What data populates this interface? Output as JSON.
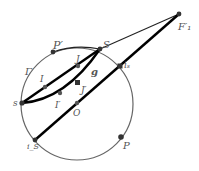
{
  "diagram": {
    "circle": {
      "label": "Γ",
      "cx": 77,
      "cy": 104,
      "r": 56,
      "color": "#666666"
    },
    "points": {
      "P_prime": {
        "label": "P′",
        "x": 53,
        "y": 52
      },
      "S": {
        "label": "S",
        "x": 100,
        "y": 49
      },
      "F1_prime": {
        "label": "F′₁",
        "x": 179,
        "y": 14
      },
      "s": {
        "label": "s",
        "x": 22,
        "y": 103
      },
      "I": {
        "label": "I",
        "x": 45,
        "y": 87
      },
      "J": {
        "label": "J",
        "x": 78,
        "y": 67
      },
      "g": {
        "label": "g"
      },
      "J_prime": {
        "label": "J′",
        "x": 77,
        "y": 82
      },
      "I_prime": {
        "label": "I′",
        "x": 60,
        "y": 93
      },
      "O": {
        "label": "O",
        "x": 77,
        "y": 103
      },
      "i_s": {
        "label": "iₛ",
        "x": 120,
        "y": 66
      },
      "i_S": {
        "label": "i_S",
        "x": 35,
        "y": 140
      },
      "P": {
        "label": "P",
        "x": 121,
        "y": 137
      }
    },
    "colors": {
      "thick_line": "#000000",
      "thin_line": "#222222",
      "point": "#333333"
    }
  }
}
